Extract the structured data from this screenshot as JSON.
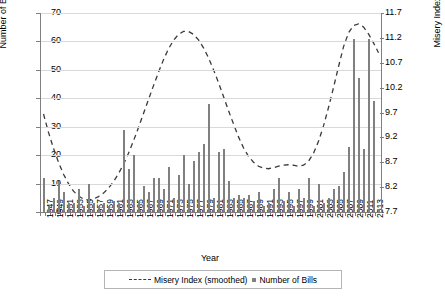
{
  "chart_data": {
    "type": "bar",
    "title": "",
    "xlabel": "Year",
    "ylabel": "Number of Bills",
    "y2label": "Misery Index",
    "ylim": [
      0,
      70
    ],
    "yticks": [
      0,
      10,
      20,
      30,
      40,
      50,
      60,
      70
    ],
    "y2lim": [
      7.7,
      11.7
    ],
    "y2ticks": [
      "7.7",
      "8.2",
      "8.7",
      "9.2",
      "9.7",
      "10.2",
      "10.7",
      "11.2",
      "11.7"
    ],
    "grid": true,
    "legend_position": "bottom",
    "legend": [
      "Misery Index (smoothed)",
      "Number of Bills"
    ],
    "x": [
      1947,
      1948,
      1949,
      1950,
      1951,
      1952,
      1953,
      1954,
      1955,
      1956,
      1957,
      1958,
      1959,
      1960,
      1961,
      1962,
      1963,
      1964,
      1965,
      1966,
      1967,
      1968,
      1969,
      1970,
      1971,
      1972,
      1973,
      1974,
      1975,
      1976,
      1977,
      1978,
      1979,
      1980,
      1981,
      1982,
      1983,
      1984,
      1985,
      1986,
      1987,
      1988,
      1989,
      1990,
      1991,
      1992,
      1993,
      1994,
      1995,
      1996,
      1997,
      1998,
      1999,
      2000,
      2001,
      2002,
      2003,
      2004,
      2005,
      2006,
      2007,
      2008,
      2009,
      2010,
      2011,
      2012,
      2013,
      2014
    ],
    "xtick_labels": [
      "1947",
      "1949",
      "1951",
      "1953",
      "1955",
      "1957",
      "1959",
      "1961",
      "1963",
      "1965",
      "1967",
      "1969",
      "1971",
      "1973",
      "1975",
      "1977",
      "1979",
      "1981",
      "1983",
      "1985",
      "1987",
      "1989",
      "1991",
      "1993",
      "1995",
      "1997",
      "1999",
      "2001",
      "2003",
      "2005",
      "2007",
      "2009",
      "2011",
      "2013"
    ],
    "series": [
      {
        "name": "Number of Bills",
        "type": "bar",
        "color": "#808080",
        "values": [
          12,
          2,
          5,
          11,
          7,
          3,
          3,
          8,
          2,
          10,
          3,
          2,
          3,
          2,
          4,
          3,
          29,
          15,
          20,
          4,
          9,
          7,
          12,
          12,
          8,
          16,
          5,
          13,
          20,
          10,
          18,
          21,
          24,
          38,
          5,
          21,
          22,
          11,
          5,
          6,
          5,
          6,
          4,
          7,
          2,
          3,
          8,
          12,
          4,
          7,
          2,
          8,
          5,
          12,
          2,
          10,
          3,
          5,
          8,
          9,
          14,
          23,
          61,
          47,
          22,
          61,
          39,
          1
        ]
      },
      {
        "name": "Misery Index (smoothed)",
        "type": "line",
        "style": "dashed",
        "color": "#3a3a3a",
        "values": [
          9.67,
          9.3,
          8.98,
          8.7,
          8.46,
          8.27,
          8.12,
          8.02,
          7.96,
          7.94,
          7.96,
          8.01,
          8.08,
          8.18,
          8.31,
          8.47,
          8.66,
          8.88,
          9.13,
          9.4,
          9.68,
          9.96,
          10.24,
          10.51,
          10.76,
          10.98,
          11.15,
          11.27,
          11.33,
          11.33,
          11.27,
          11.16,
          11.0,
          10.8,
          10.56,
          10.3,
          10.02,
          9.74,
          9.47,
          9.21,
          8.99,
          8.82,
          8.7,
          8.62,
          8.58,
          8.57,
          8.59,
          8.62,
          8.64,
          8.65,
          8.64,
          8.62,
          8.64,
          8.72,
          8.88,
          9.12,
          9.43,
          9.8,
          10.2,
          10.62,
          11.02,
          11.3,
          11.45,
          11.48,
          11.42,
          11.28,
          11.1,
          10.9
        ]
      }
    ]
  }
}
